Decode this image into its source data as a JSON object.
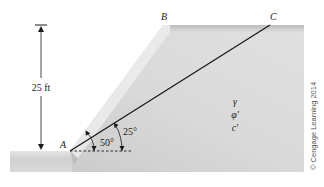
{
  "diagram": {
    "type": "slope-cross-section",
    "points": {
      "A": "A",
      "B": "B",
      "C": "C"
    },
    "height_label": "25 ft",
    "angles": {
      "slope_angle": "50°",
      "failure_plane_angle": "25°"
    },
    "soil_properties": {
      "unit_weight": "γ",
      "friction_angle": "φ′",
      "cohesion": "c′"
    },
    "copyright": "© Cengage Learning 2014",
    "colors": {
      "soil_fill": "#d6d6d6",
      "soil_edge_light": "#ededed",
      "line": "#1a1a1a"
    }
  }
}
